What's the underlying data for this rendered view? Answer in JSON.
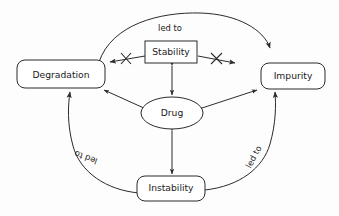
{
  "diagram": {
    "background_color": "#fdfdfd",
    "stroke_color": "#2b2b2b",
    "nodes": [
      {
        "id": "degradation",
        "label": "Degradation",
        "shape": "rounded-rectangle",
        "x": 61,
        "y": 74,
        "width": 88,
        "height": 28
      },
      {
        "id": "stability",
        "label": "Stability",
        "shape": "rectangle",
        "x": 171,
        "y": 52,
        "width": 52,
        "height": 22
      },
      {
        "id": "impurity",
        "label": "Impurity",
        "shape": "rounded-rectangle",
        "x": 293,
        "y": 76,
        "width": 64,
        "height": 26
      },
      {
        "id": "drug",
        "label": "Drug",
        "shape": "ellipse",
        "x": 172,
        "y": 113,
        "width": 62,
        "height": 32
      },
      {
        "id": "instability",
        "label": "Instability",
        "shape": "rounded-rectangle",
        "x": 171,
        "y": 188,
        "width": 68,
        "height": 25
      }
    ],
    "edges": [
      {
        "id": "degradation-to-impurity-top",
        "from": "degradation",
        "to": "impurity",
        "label": "led to",
        "label_x": 170,
        "label_y": 28,
        "label_rotation": 0,
        "arrow": "single",
        "style": "curved"
      },
      {
        "id": "instability-to-degradation-left",
        "from": "instability",
        "to": "degradation",
        "label": "led to",
        "label_x": 86,
        "label_y": 157,
        "label_rotation": 200,
        "arrow": "single",
        "style": "curved"
      },
      {
        "id": "instability-to-impurity-right",
        "from": "instability",
        "to": "impurity",
        "label": "led to",
        "label_x": 254,
        "label_y": 157,
        "label_rotation": -62,
        "arrow": "single",
        "style": "curved"
      },
      {
        "id": "stability-to-degradation-blocked",
        "from": "stability",
        "to": "degradation",
        "label": "",
        "arrow": "single",
        "style": "straight",
        "crossed_out": true
      },
      {
        "id": "stability-to-impurity-blocked",
        "from": "stability",
        "to": "impurity",
        "label": "",
        "arrow": "single",
        "style": "straight",
        "crossed_out": true
      },
      {
        "id": "stability-drug",
        "from": "stability",
        "to": "drug",
        "label": "",
        "arrow": "double",
        "style": "straight"
      },
      {
        "id": "drug-degradation",
        "from": "drug",
        "to": "degradation",
        "label": "",
        "arrow": "double",
        "style": "straight"
      },
      {
        "id": "drug-impurity",
        "from": "drug",
        "to": "impurity",
        "label": "",
        "arrow": "double",
        "style": "straight"
      },
      {
        "id": "drug-instability",
        "from": "drug",
        "to": "instability",
        "label": "",
        "arrow": "double",
        "style": "straight"
      }
    ]
  }
}
